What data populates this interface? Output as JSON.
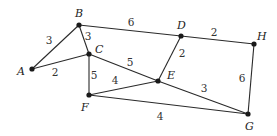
{
  "diagram": {
    "type": "weighted-undirected-graph",
    "nodes": [
      {
        "id": "A",
        "label": "A",
        "x": 32,
        "y": 69,
        "lx": 17,
        "ly": 75
      },
      {
        "id": "B",
        "label": "B",
        "x": 79,
        "y": 25,
        "lx": 75,
        "ly": 17
      },
      {
        "id": "C",
        "label": "C",
        "x": 89,
        "y": 54,
        "lx": 95,
        "ly": 53
      },
      {
        "id": "D",
        "label": "D",
        "x": 181,
        "y": 36,
        "lx": 177,
        "ly": 29
      },
      {
        "id": "E",
        "label": "E",
        "x": 158,
        "y": 81,
        "lx": 167,
        "ly": 79
      },
      {
        "id": "F",
        "label": "F",
        "x": 89,
        "y": 95,
        "lx": 81,
        "ly": 111
      },
      {
        "id": "G",
        "label": "G",
        "x": 248,
        "y": 114,
        "lx": 245,
        "ly": 130
      },
      {
        "id": "H",
        "label": "H",
        "x": 254,
        "y": 44,
        "lx": 257,
        "ly": 40
      }
    ],
    "edges": [
      {
        "from": "A",
        "to": "B",
        "weight": "3",
        "wx": 49,
        "wy": 44
      },
      {
        "from": "A",
        "to": "C",
        "weight": "2",
        "wx": 55,
        "wy": 76
      },
      {
        "from": "B",
        "to": "C",
        "weight": "3",
        "wx": 88,
        "wy": 40
      },
      {
        "from": "B",
        "to": "D",
        "weight": "6",
        "wx": 131,
        "wy": 26
      },
      {
        "from": "C",
        "to": "F",
        "weight": "5",
        "wx": 94,
        "wy": 79
      },
      {
        "from": "C",
        "to": "E",
        "weight": "5",
        "wx": 130,
        "wy": 66
      },
      {
        "from": "D",
        "to": "E",
        "weight": "2",
        "wx": 182,
        "wy": 57
      },
      {
        "from": "D",
        "to": "H",
        "weight": "2",
        "wx": 214,
        "wy": 36
      },
      {
        "from": "F",
        "to": "E",
        "weight": "4",
        "wx": 115,
        "wy": 84
      },
      {
        "from": "E",
        "to": "G",
        "weight": "3",
        "wx": 204,
        "wy": 92
      },
      {
        "from": "F",
        "to": "G",
        "weight": "4",
        "wx": 160,
        "wy": 120
      },
      {
        "from": "H",
        "to": "G",
        "weight": "6",
        "wx": 242,
        "wy": 82
      }
    ]
  }
}
